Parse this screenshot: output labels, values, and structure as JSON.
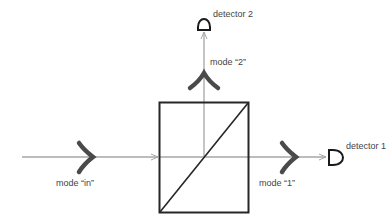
{
  "diagram": {
    "labels": {
      "detector_1": "detector 1",
      "detector_2": "detector 2",
      "mode_in": "mode “in”",
      "mode_1": "mode “1”",
      "mode_2": "mode “2”"
    },
    "colors": {
      "beam_line": "#a6a6a6",
      "box": "#262626",
      "mode_glyph": "#4a4a4a",
      "text": "#444444"
    }
  }
}
